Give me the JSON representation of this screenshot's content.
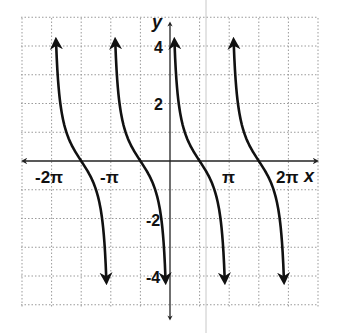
{
  "chart_data": {
    "type": "line",
    "title": "",
    "function": "y = cot(x)",
    "xlabel": "x",
    "ylabel": "y",
    "xlim": [
      -2.5,
      2.5
    ],
    "xlim_units": "pi",
    "ylim": [
      -5,
      5
    ],
    "grid": true,
    "grid_style": "dotted",
    "x_grid_step": "pi/2",
    "y_grid_step": 1,
    "x_tick_labels": [
      {
        "value": -2,
        "label": "-2π"
      },
      {
        "value": -1,
        "label": "-π"
      },
      {
        "value": 1,
        "label": "π"
      },
      {
        "value": 2,
        "label": "2π"
      }
    ],
    "y_tick_labels": [
      {
        "value": 4,
        "label": "4"
      },
      {
        "value": 2,
        "label": "2"
      },
      {
        "value": -2,
        "label": "-2"
      },
      {
        "value": -4,
        "label": "-4"
      }
    ],
    "series": [
      {
        "name": "branch-1",
        "domain": [
          "-2π",
          "-π"
        ],
        "x_intercept": "-3π/2",
        "vertical_asymptotes": [
          "-2π",
          "-π"
        ]
      },
      {
        "name": "branch-2",
        "domain": [
          "-π",
          "0"
        ],
        "x_intercept": "-π/2",
        "vertical_asymptotes": [
          "-π",
          "0"
        ]
      },
      {
        "name": "branch-3",
        "domain": [
          "0",
          "π"
        ],
        "x_intercept": "π/2",
        "vertical_asymptotes": [
          "0",
          "π"
        ]
      },
      {
        "name": "branch-4",
        "domain": [
          "π",
          "2π"
        ],
        "x_intercept": "3π/2",
        "vertical_asymptotes": [
          "π",
          "2π"
        ]
      }
    ],
    "legend": null
  },
  "axes": {
    "x_label": "x",
    "y_label": "y",
    "x_ticks": [
      "-2π",
      "-π",
      "π",
      "2π"
    ],
    "y_ticks": [
      "4",
      "2",
      "-2",
      "-4"
    ]
  },
  "colors": {
    "curve": "#111111",
    "axis": "#222222",
    "grid": "#9a9a9a",
    "background": "#ffffff"
  }
}
